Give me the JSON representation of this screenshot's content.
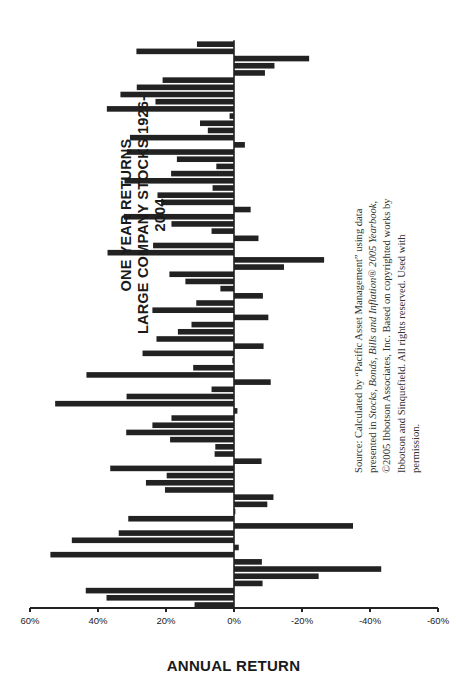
{
  "chart_data": {
    "type": "bar",
    "orientation_note": "figure is printed rotated 90 degrees counterclockwise",
    "title": "ONE YEAR RETURNS",
    "subtitle": "LARGE COMPANY STOCKS 1926-2004",
    "xlabel": "",
    "ylabel": "ANNUAL RETURN",
    "ylim": [
      -60,
      60
    ],
    "yticks": [
      "60%",
      "40%",
      "20%",
      "0%",
      "-20%",
      "-40%",
      "-60%"
    ],
    "grid": false,
    "legend": null,
    "categories": [
      1926,
      1927,
      1928,
      1929,
      1930,
      1931,
      1932,
      1933,
      1934,
      1935,
      1936,
      1937,
      1938,
      1939,
      1940,
      1941,
      1942,
      1943,
      1944,
      1945,
      1946,
      1947,
      1948,
      1949,
      1950,
      1951,
      1952,
      1953,
      1954,
      1955,
      1956,
      1957,
      1958,
      1959,
      1960,
      1961,
      1962,
      1963,
      1964,
      1965,
      1966,
      1967,
      1968,
      1969,
      1970,
      1971,
      1972,
      1973,
      1974,
      1975,
      1976,
      1977,
      1978,
      1979,
      1980,
      1981,
      1982,
      1983,
      1984,
      1985,
      1986,
      1987,
      1988,
      1989,
      1990,
      1991,
      1992,
      1993,
      1994,
      1995,
      1996,
      1997,
      1998,
      1999,
      2000,
      2001,
      2002,
      2003,
      2004
    ],
    "values": [
      11.6,
      37.5,
      43.6,
      -8.4,
      -24.9,
      -43.3,
      -8.2,
      54.0,
      -1.4,
      47.7,
      33.9,
      -35.0,
      31.1,
      -0.4,
      -9.8,
      -11.6,
      20.3,
      25.9,
      19.8,
      36.4,
      -8.1,
      5.7,
      5.5,
      18.8,
      31.7,
      24.0,
      18.4,
      -1.0,
      52.6,
      31.6,
      6.6,
      -10.8,
      43.4,
      12.0,
      0.5,
      26.9,
      -8.7,
      22.8,
      16.5,
      12.5,
      -10.1,
      24.0,
      11.1,
      -8.5,
      4.0,
      14.3,
      19.0,
      -14.7,
      -26.5,
      37.2,
      23.8,
      -7.2,
      6.6,
      18.4,
      32.4,
      -4.9,
      21.4,
      22.5,
      6.3,
      32.2,
      18.5,
      5.2,
      16.8,
      31.5,
      -3.2,
      30.6,
      7.7,
      10.0,
      1.3,
      37.4,
      23.1,
      33.4,
      28.6,
      21.0,
      -9.1,
      -11.9,
      -22.1,
      28.7,
      10.9
    ],
    "bar_color": "#222222"
  },
  "source_note": {
    "prefix": "Source: Calculated by “Pacific Asset Management” using data presented in ",
    "italic1": "Stocks, Bonds, Bills and Inflation® 2005 Yearbook",
    "suffix": ", ©2005 Ibbotson Associates, Inc. Based on copyrighted works by Ibbotson and Sinquefield. All rights reserved. Used with permission."
  }
}
